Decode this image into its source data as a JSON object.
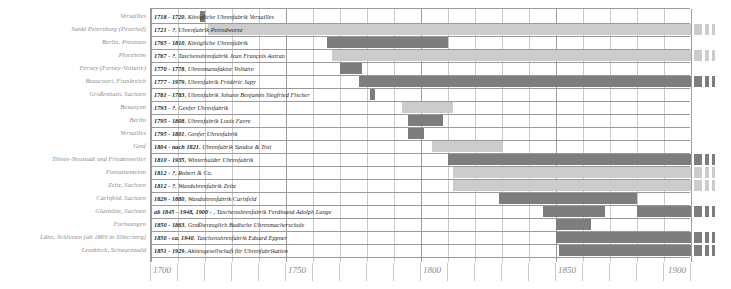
{
  "chart_data": {
    "type": "bar",
    "orientation": "horizontal-timeline",
    "title": "",
    "xlabel": "",
    "ylabel": "",
    "xlim": [
      1700,
      1900
    ],
    "xticks": [
      1700,
      1750,
      1800,
      1850,
      1900
    ],
    "xtick_labels": [
      "1700",
      "1750",
      "1800",
      "1850",
      "1900"
    ],
    "minor_tick_step": 10,
    "grid": true,
    "legend": "",
    "colors": {
      "bar_known": "#7d7d7d",
      "bar_open": "#cccccc",
      "grid_minor": "#c9c9c9",
      "grid_major": "#9d9d9d",
      "label_text": "#8a8a8a",
      "bar_text": "#1c1c1c",
      "background": "#ffffff"
    },
    "categories": [
      "Versailles",
      "Sankt Petersburg (Peterhof)",
      "Berlin, Preussen",
      "Pforzheim",
      "Ferney (Ferney-Voltaire)",
      "Beaucourt, Frankreich",
      "Großenhain, Sachsen",
      "Besançon",
      "Berlin",
      "Versailles",
      "Genf",
      "Titisee-Neustadt und Friedenweiler",
      "Fontainemelon",
      "Zeitz, Sachsen",
      "Carlsfeld, Sachsen",
      "Glashütte, Sachsen",
      "Furtwangen",
      "Lähn, Schlesien (ab 1869 in Silberberg)",
      "Lenzkirch, Schwarzwald"
    ],
    "rows": [
      {
        "location": "Versailles",
        "date_text": "1718 - 1720",
        "name": "Königliche Uhrenfabrik Versailles",
        "label": "1718 - 1720, Königliche Uhrenfabrik Versailles",
        "start": 1718,
        "end": 1720,
        "open_ended": false,
        "continues_past_axis": false,
        "segments": [
          {
            "start": 1718,
            "end": 1720,
            "shade": "dark"
          }
        ]
      },
      {
        "location": "Sankt Petersburg (Peterhof)",
        "date_text": "1721 - ?",
        "name": "Uhrenfabrik Petrodworez",
        "label": "1721 - ?, Uhrenfabrik Petrodworez",
        "start": 1721,
        "end": null,
        "open_ended": true,
        "continues_past_axis": true,
        "segments": [
          {
            "start": 1721,
            "end": 1900,
            "shade": "light"
          }
        ]
      },
      {
        "location": "Berlin, Preussen",
        "date_text": "1765 - 1810",
        "name": "Königliche Uhrenfabrik",
        "label": "1765 - 1810, Königliche Uhrenfabrik",
        "start": 1765,
        "end": 1810,
        "open_ended": false,
        "continues_past_axis": false,
        "segments": [
          {
            "start": 1765,
            "end": 1810,
            "shade": "dark"
          }
        ]
      },
      {
        "location": "Pforzheim",
        "date_text": "1767 - ?",
        "name": "Taschenuhrenfabrik Jean François Autran",
        "label": "1767 - ?, Taschenuhrenfabrik Jean François Autran",
        "start": 1767,
        "end": null,
        "open_ended": true,
        "continues_past_axis": true,
        "segments": [
          {
            "start": 1767,
            "end": 1900,
            "shade": "light"
          }
        ]
      },
      {
        "location": "Ferney (Ferney-Voltaire)",
        "date_text": "1770 - 1778",
        "name": "Uhrenmanufaktur Voltaire",
        "label": "1770 - 1778, Uhrenmanufaktur Voltaire",
        "start": 1770,
        "end": 1778,
        "open_ended": false,
        "continues_past_axis": false,
        "segments": [
          {
            "start": 1770,
            "end": 1778,
            "shade": "dark"
          }
        ]
      },
      {
        "location": "Beaucourt, Frankreich",
        "date_text": "1777 - 1979",
        "name": "Uhrenfabrik Frédéric Japy",
        "label": "1777 - 1979, Uhrenfabrik Frédéric Japy",
        "start": 1777,
        "end": 1979,
        "open_ended": false,
        "continues_past_axis": true,
        "segments": [
          {
            "start": 1777,
            "end": 1900,
            "shade": "dark"
          }
        ]
      },
      {
        "location": "Großenhain, Sachsen",
        "date_text": "1781 - 1783",
        "name": "Uhrenfabrik Johann Benjamin Siegfried Fischer",
        "label": "1781 - 1783, Uhrenfabrik Johann Benjamin Siegfried Fischer",
        "start": 1781,
        "end": 1783,
        "open_ended": false,
        "continues_past_axis": false,
        "segments": [
          {
            "start": 1781,
            "end": 1783,
            "shade": "dark"
          }
        ]
      },
      {
        "location": "Besançon",
        "date_text": "1793 - ?",
        "name": "Genfer Uhrenfabrik",
        "label": "1793 - ?, Genfer Uhrenfabrik",
        "start": 1793,
        "end": null,
        "open_ended": true,
        "continues_past_axis": false,
        "segments": [
          {
            "start": 1793,
            "end": 1812,
            "shade": "light"
          }
        ]
      },
      {
        "location": "Berlin",
        "date_text": "1795 - 1808",
        "name": "Uhrenfabrik Louis Favre",
        "label": "1795 - 1808, Uhrenfabrik Louis Favre",
        "start": 1795,
        "end": 1808,
        "open_ended": false,
        "continues_past_axis": false,
        "segments": [
          {
            "start": 1795,
            "end": 1808,
            "shade": "dark"
          }
        ]
      },
      {
        "location": "Versailles",
        "date_text": "1795 - 1801",
        "name": "Genfer Uhrenfabrik",
        "label": "1795 - 1801, Genfer Uhrenfabrik",
        "start": 1795,
        "end": 1801,
        "open_ended": false,
        "continues_past_axis": false,
        "segments": [
          {
            "start": 1795,
            "end": 1801,
            "shade": "dark"
          }
        ]
      },
      {
        "location": "Genf",
        "date_text": "1804 - nach 1821",
        "name": "Uhrenfabrik Sandoz & Trot",
        "label": "1804 - nach 1821, Uhrenfabrik Sandoz & Trot",
        "start": 1804,
        "end": 1821,
        "open_ended": true,
        "continues_past_axis": false,
        "segments": [
          {
            "start": 1804,
            "end": 1830,
            "shade": "light"
          }
        ]
      },
      {
        "location": "Titisee-Neustadt und Friedenweiler",
        "date_text": "1810 - 1935",
        "name": "Winterhalder Uhrenfabrik",
        "label": "1810 - 1935, Winterhalder Uhrenfabrik",
        "start": 1810,
        "end": 1935,
        "open_ended": false,
        "continues_past_axis": true,
        "segments": [
          {
            "start": 1810,
            "end": 1900,
            "shade": "dark"
          }
        ]
      },
      {
        "location": "Fontainemelon",
        "date_text": "1812 - ?",
        "name": "Robert & Co.",
        "label": "1812 - ?, Robert & Co.",
        "start": 1812,
        "end": null,
        "open_ended": true,
        "continues_past_axis": true,
        "segments": [
          {
            "start": 1812,
            "end": 1900,
            "shade": "light"
          }
        ]
      },
      {
        "location": "Zeitz, Sachsen",
        "date_text": "1812 - ?",
        "name": "Wanduhrenfabrik Zeitz",
        "label": "1812 - ?, Wanduhrenfabrik Zeitz",
        "start": 1812,
        "end": null,
        "open_ended": true,
        "continues_past_axis": true,
        "segments": [
          {
            "start": 1812,
            "end": 1900,
            "shade": "light"
          }
        ]
      },
      {
        "location": "Carlsfeld, Sachsen",
        "date_text": "1829 - 1880",
        "name": "Wanduhrenfabrik Carlsfeld",
        "label": "1829 - 1880, Wanduhrenfabrik Carlsfeld",
        "start": 1829,
        "end": 1880,
        "open_ended": false,
        "continues_past_axis": false,
        "segments": [
          {
            "start": 1829,
            "end": 1880,
            "shade": "dark"
          }
        ]
      },
      {
        "location": "Glashütte, Sachsen",
        "date_text": "ab 1845 - 1948, 1900 - ",
        "name": "Taschenuhrenfabrik Ferdinand Adolph Lange",
        "label": "ab 1845 - 1948, 1900 - , Taschenuhrenfabrik Ferdinand Adolph Lange",
        "start": 1845,
        "end": 1948,
        "open_ended": true,
        "continues_past_axis": true,
        "segments": [
          {
            "start": 1845,
            "end": 1868,
            "shade": "dark"
          },
          {
            "start": 1880,
            "end": 1900,
            "shade": "dark"
          }
        ]
      },
      {
        "location": "Furtwangen",
        "date_text": "1850 - 1863",
        "name": "Großherzoglich Badische Uhrenmacherschule",
        "label": "1850 - 1863, Großherzoglich Badische Uhrenmacherschule",
        "start": 1850,
        "end": 1863,
        "open_ended": false,
        "continues_past_axis": false,
        "segments": [
          {
            "start": 1850,
            "end": 1863,
            "shade": "dark"
          }
        ]
      },
      {
        "location": "Lähn, Schlesien (ab 1869 in Silberberg)",
        "date_text": "1850 - ca. 1940",
        "name": "Taschenuhrenfabrik Eduard Eppner",
        "label": "1850 - ca. 1940, Taschenuhrenfabrik Eduard Eppner",
        "start": 1850,
        "end": 1940,
        "open_ended": false,
        "continues_past_axis": true,
        "segments": [
          {
            "start": 1850,
            "end": 1900,
            "shade": "dark"
          }
        ]
      },
      {
        "location": "Lenzkirch, Schwarzwald",
        "date_text": "1851 - 1929",
        "name": "Aktiengesellschaft für Uhrenfabrikation",
        "label": "1851 - 1929, Aktiengesellschaft für Uhrenfabrikation",
        "start": 1851,
        "end": 1929,
        "open_ended": false,
        "continues_past_axis": true,
        "segments": [
          {
            "start": 1851,
            "end": 1900,
            "shade": "dark"
          }
        ]
      }
    ]
  }
}
